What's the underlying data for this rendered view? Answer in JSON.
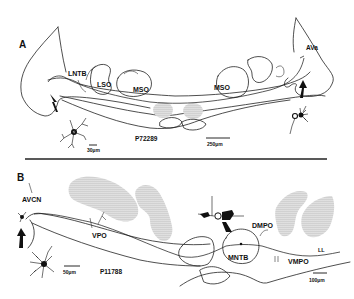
{
  "figure": {
    "panels": [
      {
        "id": "A",
        "label": "A",
        "specimen_id": "P72289",
        "regions": [
          "LNTB",
          "LSO",
          "MSO",
          "MSO",
          "AVa"
        ],
        "labels": {
          "lntb": "LNTB",
          "lso": "LSO",
          "mso_left": "MSO",
          "mso_right": "MSO",
          "ava": "AVa"
        },
        "scale_bars": {
          "neuron": "30µm",
          "section": "250µm"
        }
      },
      {
        "id": "B",
        "label": "B",
        "specimen_id": "P11788",
        "regions": [
          "AVCN",
          "VPO",
          "DMPO",
          "MNTB",
          "VMPO",
          "LL"
        ],
        "labels": {
          "avcn": "AVCN",
          "vpo": "VPO",
          "dmpo": "DMPO",
          "mntb": "MNTB",
          "vmpo": "VMPO",
          "ll": "LL"
        },
        "scale_bars": {
          "neuron": "50µm",
          "section": "100µm"
        }
      }
    ],
    "colors": {
      "ink": "#111111",
      "background": "#ffffff",
      "stipple": "#555555"
    }
  }
}
